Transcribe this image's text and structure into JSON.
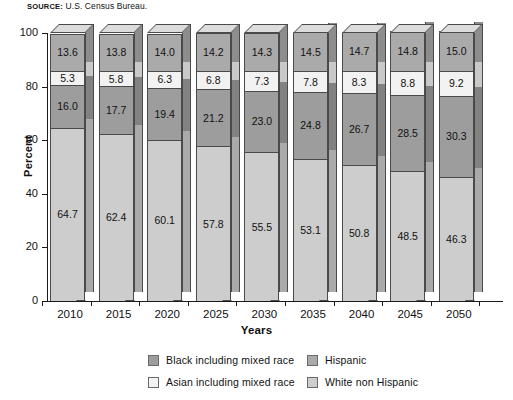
{
  "source": {
    "label": "SOURCE:",
    "text": "U.S. Census Bureau."
  },
  "chart_data": {
    "type": "bar",
    "subtype": "stacked-100-percent-3d",
    "title": "",
    "xlabel": "Years",
    "ylabel": "Percent",
    "ylim": [
      0,
      100
    ],
    "yticks": [
      0,
      20,
      40,
      60,
      80,
      100
    ],
    "grid": false,
    "legend_position": "bottom",
    "categories": [
      "2010",
      "2015",
      "2020",
      "2025",
      "2030",
      "2035",
      "2040",
      "2045",
      "2050"
    ],
    "stack_order_bottom_to_top": [
      "White non Hispanic",
      "Black including mixed race",
      "Asian including mixed race",
      "Hispanic"
    ],
    "series": [
      {
        "name": "White non Hispanic",
        "color": "#cdcdcd",
        "values": [
          64.7,
          62.4,
          60.1,
          57.8,
          55.5,
          53.1,
          50.8,
          48.5,
          46.3
        ]
      },
      {
        "name": "Black including mixed race",
        "color": "#9d9d9d",
        "values": [
          16.0,
          17.7,
          19.4,
          21.2,
          23.0,
          24.8,
          26.7,
          28.5,
          30.3
        ]
      },
      {
        "name": "Asian including mixed race",
        "color": "#f2f2f2",
        "values": [
          5.3,
          5.8,
          6.3,
          6.8,
          7.3,
          7.8,
          8.3,
          8.8,
          9.2
        ]
      },
      {
        "name": "Hispanic",
        "color": "#aaaaaa",
        "values": [
          13.6,
          13.8,
          14.0,
          14.2,
          14.3,
          14.5,
          14.7,
          14.8,
          15.0
        ]
      }
    ],
    "legend": [
      {
        "label": "Black including mixed race",
        "color": "#9d9d9d"
      },
      {
        "label": "Hispanic",
        "color": "#aaaaaa"
      },
      {
        "label": "Asian including mixed race",
        "color": "#f2f2f2"
      },
      {
        "label": "White non Hispanic",
        "color": "#cdcdcd"
      }
    ]
  },
  "colors": {
    "axis": "#1a1a1a",
    "bar_outline": "#4a4a4a",
    "top_face": "#dcdcdc",
    "background": "#ffffff"
  }
}
